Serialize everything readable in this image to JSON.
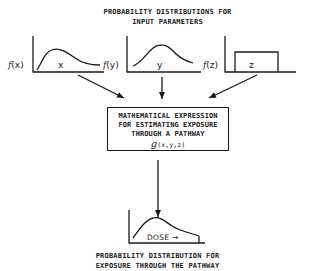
{
  "header": {
    "title_line1": "PROBABILITY DISTRIBUTIONS FOR",
    "title_line2": "INPUT PARAMETERS"
  },
  "inputs": [
    {
      "function_label": "f",
      "arg": "(x)",
      "variable": "x",
      "shape": "skewed-curve"
    },
    {
      "function_label": "f",
      "arg": "(y)",
      "variable": "y",
      "shape": "bell-curve"
    },
    {
      "function_label": "f",
      "arg": "(z)",
      "variable": "z",
      "shape": "uniform-rectangle"
    }
  ],
  "process_box": {
    "line1": "MATHEMATICAL EXPRESSION",
    "line2": "FOR ESTIMATING EXPOSURE",
    "line3": "THROUGH A PATHWAY",
    "function_symbol": "g",
    "function_args": "(x,y,z)"
  },
  "output": {
    "axis_label": "DOSE",
    "axis_arrow": "→",
    "shape": "right-skewed-curve",
    "caption_line1": "PROBABILITY DISTRIBUTION FOR",
    "caption_line2": "EXPOSURE THROUGH THE PATHWAY"
  },
  "colors": {
    "ink": "#1a1a1a",
    "background": "#ffffff"
  }
}
